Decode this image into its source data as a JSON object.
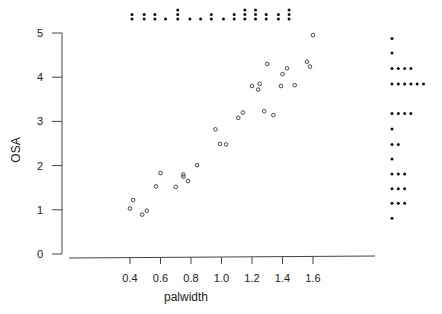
{
  "chart_data": {
    "type": "scatter",
    "title": "",
    "xlabel": "palwidth",
    "ylabel": "OSA",
    "xlim": [
      0.2,
      1.95
    ],
    "ylim": [
      0,
      5
    ],
    "grid": false,
    "x_ticks": [
      "0.4",
      "0.6",
      "0.8",
      "1.0",
      "1.2",
      "1.4",
      "1.6"
    ],
    "y_ticks": [
      "0",
      "1",
      "2",
      "3",
      "4",
      "5"
    ],
    "points": [
      {
        "x": 0.4,
        "y": 1.03
      },
      {
        "x": 0.42,
        "y": 1.22
      },
      {
        "x": 0.48,
        "y": 0.89
      },
      {
        "x": 0.51,
        "y": 0.98
      },
      {
        "x": 0.57,
        "y": 1.53
      },
      {
        "x": 0.6,
        "y": 1.83
      },
      {
        "x": 0.7,
        "y": 1.52
      },
      {
        "x": 0.75,
        "y": 1.75
      },
      {
        "x": 0.75,
        "y": 1.8
      },
      {
        "x": 0.78,
        "y": 1.65
      },
      {
        "x": 0.84,
        "y": 2.01
      },
      {
        "x": 0.96,
        "y": 2.82
      },
      {
        "x": 0.99,
        "y": 2.49
      },
      {
        "x": 1.03,
        "y": 2.48
      },
      {
        "x": 1.11,
        "y": 3.08
      },
      {
        "x": 1.14,
        "y": 3.2
      },
      {
        "x": 1.2,
        "y": 3.8
      },
      {
        "x": 1.24,
        "y": 3.72
      },
      {
        "x": 1.25,
        "y": 3.85
      },
      {
        "x": 1.28,
        "y": 3.23
      },
      {
        "x": 1.3,
        "y": 4.3
      },
      {
        "x": 1.34,
        "y": 3.14
      },
      {
        "x": 1.39,
        "y": 3.8
      },
      {
        "x": 1.4,
        "y": 4.07
      },
      {
        "x": 1.43,
        "y": 4.2
      },
      {
        "x": 1.48,
        "y": 3.82
      },
      {
        "x": 1.56,
        "y": 4.35
      },
      {
        "x": 1.58,
        "y": 4.24
      },
      {
        "x": 1.6,
        "y": 4.95
      }
    ],
    "marginal_x_dotplot": {
      "description": "Dot plot of palwidth along top margin",
      "columns": [
        {
          "x": 0.4,
          "count": 2
        },
        {
          "x": 0.48,
          "count": 2
        },
        {
          "x": 0.55,
          "count": 2
        },
        {
          "x": 0.62,
          "count": 1
        },
        {
          "x": 0.7,
          "count": 3
        },
        {
          "x": 0.78,
          "count": 1
        },
        {
          "x": 0.85,
          "count": 1
        },
        {
          "x": 0.92,
          "count": 2
        },
        {
          "x": 1.0,
          "count": 1
        },
        {
          "x": 1.07,
          "count": 2
        },
        {
          "x": 1.14,
          "count": 3
        },
        {
          "x": 1.21,
          "count": 3
        },
        {
          "x": 1.28,
          "count": 2
        },
        {
          "x": 1.36,
          "count": 2
        },
        {
          "x": 1.43,
          "count": 3
        }
      ]
    },
    "marginal_y_dotplot": {
      "description": "Dot plot of OSA along right margin",
      "rows": [
        {
          "y": 4.9,
          "count": 1
        },
        {
          "y": 4.57,
          "count": 1
        },
        {
          "y": 4.22,
          "count": 4
        },
        {
          "y": 3.87,
          "count": 6
        },
        {
          "y": 3.2,
          "count": 4
        },
        {
          "y": 2.85,
          "count": 1
        },
        {
          "y": 2.5,
          "count": 2
        },
        {
          "y": 2.17,
          "count": 1
        },
        {
          "y": 1.83,
          "count": 3
        },
        {
          "y": 1.5,
          "count": 3
        },
        {
          "y": 1.17,
          "count": 3
        },
        {
          "y": 0.83,
          "count": 1
        }
      ]
    }
  }
}
